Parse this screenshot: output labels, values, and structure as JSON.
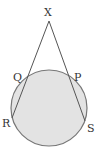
{
  "diagram": {
    "title": "",
    "labels": {
      "X": "X",
      "Q": "Q",
      "P": "P",
      "R": "R",
      "S": "S"
    },
    "points": {
      "X": {
        "x": 49,
        "y": 21
      },
      "Q": {
        "x": 27,
        "y": 79
      },
      "P": {
        "x": 71,
        "y": 78
      },
      "R": {
        "x": 12,
        "y": 118
      },
      "S": {
        "x": 85,
        "y": 121
      }
    },
    "circle": {
      "cx": 49,
      "cy": 108,
      "r": 38,
      "fill": "#e3e3e3",
      "stroke": "#777777"
    },
    "line_color": "#555555"
  }
}
